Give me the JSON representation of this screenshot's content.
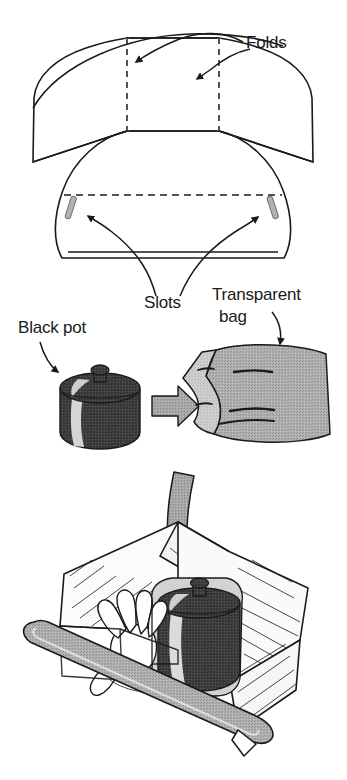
{
  "figure": {
    "type": "instructional-line-diagram",
    "background_color": "#ffffff",
    "line_color": "#1a1a1a",
    "panels": [
      {
        "id": "panel-reflector-template",
        "order": 1,
        "description": "Flat cut-out pattern of the reflector lid with two dashed fold lines and two slots",
        "labels": [
          "Folds",
          "Slots"
        ]
      },
      {
        "id": "panel-pot-into-bag",
        "order": 2,
        "description": "A black cooking pot with lid, a transition arrow, and a transparent plastic bag",
        "labels": [
          "Black pot",
          "Transparent bag"
        ]
      },
      {
        "id": "panel-pot-into-cooker",
        "order": 3,
        "description": "A hand placing the bagged black pot inside the open solar box cooker; a large curved arrow indicates the downward placement motion",
        "labels": []
      }
    ]
  },
  "labels": {
    "folds": "Folds",
    "slots": "Slots",
    "black_pot": "Black pot",
    "transparent_bag_line1": "Transparent",
    "transparent_bag_line2": "bag"
  },
  "colors": {
    "ink": "#1a1a1a",
    "paper": "#ffffff",
    "mid_gray": "#a8a8a8",
    "light_gray": "#c9c9c9",
    "pale_gray": "#e3e3e3",
    "pot_dark": "#3a3a3a",
    "pot_highlight": "#e8e8e8",
    "arrow_gray": "#9e9e9e",
    "slot_gray": "#9a9a9a"
  },
  "icons": {
    "fold_arrow": "curved-arrow-icon",
    "slot_arrow": "curved-arrow-icon",
    "pot_arrow": "curved-arrow-icon",
    "bag_arrow": "curved-arrow-icon",
    "transition_arrow": "right-arrow-icon",
    "placement_arrow": "curved-down-arrow-icon"
  }
}
